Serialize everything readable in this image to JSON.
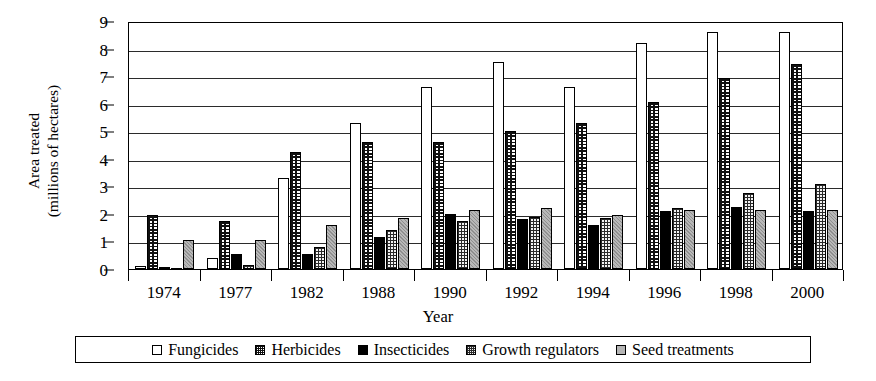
{
  "chart_data": {
    "type": "bar",
    "title": "",
    "xlabel": "Year",
    "ylabel": "Area treated (millions of hectares)",
    "ylabel_line1": "Area treated",
    "ylabel_line2": "(millions of hectares)",
    "ylim": [
      0,
      9
    ],
    "ytick_values": [
      0,
      1,
      2,
      3,
      4,
      5,
      6,
      7,
      8,
      9
    ],
    "ytick_labels": [
      "0",
      "1",
      "2",
      "3",
      "4",
      "5",
      "6",
      "7",
      "8",
      "9"
    ],
    "grid": true,
    "grid_axis": "y",
    "legend_position": "bottom",
    "categories": [
      "1974",
      "1977",
      "1982",
      "1988",
      "1990",
      "1992",
      "1994",
      "1996",
      "1998",
      "2000"
    ],
    "series": [
      {
        "name": "Fungicides",
        "fill": "white",
        "color": "#ffffff",
        "values": [
          0.1,
          0.4,
          3.3,
          5.3,
          6.6,
          7.5,
          6.6,
          8.2,
          8.6,
          8.6
        ]
      },
      {
        "name": "Herbicides",
        "fill": "dotted-grid",
        "color": "#ffffff",
        "values": [
          1.95,
          1.75,
          4.25,
          4.6,
          4.6,
          5.0,
          5.3,
          6.05,
          6.95,
          7.45
        ]
      },
      {
        "name": "Insecticides",
        "fill": "solid-black",
        "color": "#000000",
        "values": [
          0.05,
          0.55,
          0.55,
          1.15,
          2.0,
          1.8,
          1.6,
          2.1,
          2.25,
          2.1
        ]
      },
      {
        "name": "Growth regulators",
        "fill": "cross-hatch",
        "color": "#f0f0f0",
        "values": [
          0.0,
          0.15,
          0.8,
          1.4,
          1.75,
          1.9,
          1.85,
          2.2,
          2.75,
          3.1
        ]
      },
      {
        "name": "Seed treatments",
        "fill": "light-gray",
        "color": "#b8b8b8",
        "values": [
          1.05,
          1.05,
          1.6,
          1.85,
          2.15,
          2.2,
          1.95,
          2.15,
          2.15,
          2.15
        ]
      }
    ]
  }
}
